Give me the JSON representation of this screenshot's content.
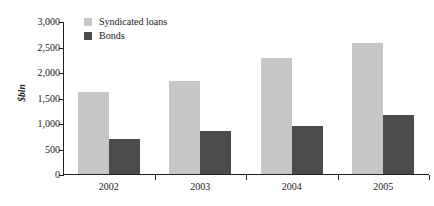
{
  "chart_data": {
    "type": "bar",
    "title": "",
    "subtitle": "",
    "xlabel": "",
    "ylabel": "$bln",
    "categories": [
      "2002",
      "2003",
      "2004",
      "2005"
    ],
    "series": [
      {
        "name": "Syndicated loans",
        "color": "#c6c6c6",
        "values": [
          1600,
          1830,
          2280,
          2570
        ]
      },
      {
        "name": "Bonds",
        "color": "#4b4b4b",
        "values": [
          680,
          850,
          950,
          1150
        ]
      }
    ],
    "ylim": [
      0,
      3000
    ],
    "ytick_values": [
      0,
      500,
      1000,
      1500,
      2000,
      2500,
      3000
    ],
    "ytick_labels": [
      "0",
      "500",
      "1,000",
      "1,500",
      "2,000",
      "2,500",
      "3,000"
    ],
    "grid": false,
    "legend_position": "top-left-inside",
    "axis_color": "#222222",
    "background": "#ffffff"
  }
}
